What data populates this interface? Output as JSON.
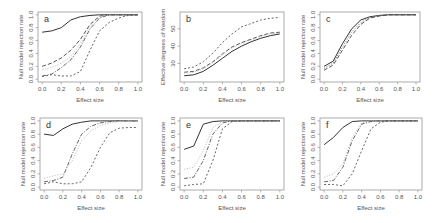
{
  "chart_data": [
    {
      "type": "line",
      "panel": "a",
      "title": "a",
      "xlabel": "Effect size",
      "ylabel": "Null model rejection rate",
      "xlim": [
        0,
        1
      ],
      "ylim": [
        0,
        1
      ],
      "xticks": [
        "0.0",
        "0.2",
        "0.4",
        "0.6",
        "0.8",
        "1.0"
      ],
      "yticks": [
        "0.0",
        "0.2",
        "0.4",
        "0.6",
        "0.8",
        "1.0"
      ],
      "x": [
        0,
        0.1,
        0.2,
        0.3,
        0.4,
        0.5,
        0.6,
        0.7,
        0.8,
        0.9,
        1.0
      ],
      "series": [
        {
          "name": "solid",
          "style": "solid",
          "color": "#333333",
          "values": [
            0.73,
            0.75,
            0.8,
            0.92,
            0.97,
            0.99,
            1,
            1,
            1,
            1,
            1
          ]
        },
        {
          "name": "long-dash",
          "style": "dashed",
          "color": "#444444",
          "values": [
            0.2,
            0.25,
            0.33,
            0.45,
            0.62,
            0.85,
            0.98,
            1,
            1,
            1,
            1
          ]
        },
        {
          "name": "light",
          "style": "dotted",
          "color": "#bbbbbb",
          "values": [
            0.15,
            0.18,
            0.25,
            0.35,
            0.55,
            0.82,
            0.97,
            1,
            1,
            1,
            1
          ]
        },
        {
          "name": "dash-dot",
          "style": "dashdot",
          "color": "#555555",
          "values": [
            0.05,
            0.08,
            0.18,
            0.3,
            0.5,
            0.78,
            0.95,
            1,
            1,
            1,
            1
          ]
        },
        {
          "name": "short-dash",
          "style": "shortdash",
          "color": "#555555",
          "values": [
            0.04,
            0.07,
            0.05,
            0.05,
            0.12,
            0.45,
            0.75,
            0.88,
            0.95,
            0.99,
            1
          ]
        }
      ]
    },
    {
      "type": "line",
      "panel": "b",
      "title": "b",
      "xlabel": "Effect size",
      "ylabel": "Effective degrees of freedom",
      "xlim": [
        0,
        1
      ],
      "ylim": [
        21,
        58
      ],
      "xticks": [
        "0.0",
        "0.2",
        "0.4",
        "0.6",
        "0.8",
        "1.0"
      ],
      "yticks": [
        "30",
        "40",
        "50"
      ],
      "x": [
        0,
        0.1,
        0.2,
        0.3,
        0.4,
        0.5,
        0.6,
        0.7,
        0.8,
        0.9,
        1.0
      ],
      "series": [
        {
          "name": "short-dash",
          "style": "shortdash",
          "color": "#555555",
          "values": [
            27,
            28,
            31,
            36,
            42,
            47,
            51,
            53,
            55,
            56,
            56.5
          ]
        },
        {
          "name": "long-dash",
          "style": "dashed",
          "color": "#444444",
          "values": [
            25,
            25.5,
            27.5,
            31,
            35.5,
            39.5,
            42,
            44,
            46,
            47.5,
            48
          ]
        },
        {
          "name": "light",
          "style": "dotted",
          "color": "#bbbbbb",
          "values": [
            24.5,
            25,
            27,
            30.5,
            35,
            39,
            41.5,
            43.5,
            45.5,
            47,
            47.5
          ]
        },
        {
          "name": "solid",
          "style": "solid",
          "color": "#333333",
          "values": [
            23,
            23.5,
            25.5,
            29,
            33,
            37,
            40,
            42.5,
            44.5,
            46,
            47
          ]
        }
      ]
    },
    {
      "type": "line",
      "panel": "c",
      "title": "c",
      "xlabel": "Effect size",
      "ylabel": "Null model rejection rate",
      "xlim": [
        0,
        1
      ],
      "ylim": [
        0,
        1
      ],
      "xticks": [
        "0.0",
        "0.2",
        "0.4",
        "0.6",
        "0.8",
        "1.0"
      ],
      "yticks": [
        "0.0",
        "0.2",
        "0.4",
        "0.6",
        "0.8",
        "1.0"
      ],
      "x": [
        0,
        0.1,
        0.2,
        0.3,
        0.4,
        0.5,
        0.6,
        0.7,
        0.8,
        0.9,
        1.0
      ],
      "series": [
        {
          "name": "solid",
          "style": "solid",
          "color": "#333333",
          "values": [
            0.2,
            0.28,
            0.55,
            0.78,
            0.92,
            0.97,
            0.99,
            1,
            1,
            1,
            1
          ]
        },
        {
          "name": "dotted",
          "style": "dotted",
          "color": "#777777",
          "values": [
            0.17,
            0.25,
            0.5,
            0.73,
            0.88,
            0.96,
            0.99,
            1,
            1,
            1,
            1
          ]
        },
        {
          "name": "dashed",
          "style": "dashed",
          "color": "#444444",
          "values": [
            0.14,
            0.22,
            0.45,
            0.68,
            0.85,
            0.95,
            0.98,
            1,
            1,
            1,
            1
          ]
        }
      ]
    },
    {
      "type": "line",
      "panel": "d",
      "title": "d",
      "xlabel": "Effect size",
      "ylabel": "Null model rejection rate",
      "xlim": [
        0,
        1
      ],
      "ylim": [
        0,
        1
      ],
      "xticks": [
        "0.0",
        "0.2",
        "0.4",
        "0.6",
        "0.8",
        "1.0"
      ],
      "yticks": [
        "0.0",
        "0.2",
        "0.4",
        "0.6",
        "0.8",
        "1.0"
      ],
      "x": [
        0,
        0.1,
        0.2,
        0.3,
        0.4,
        0.5,
        0.6,
        0.7,
        0.8,
        0.9,
        1.0
      ],
      "series": [
        {
          "name": "solid",
          "style": "solid",
          "color": "#333333",
          "values": [
            0.8,
            0.78,
            0.88,
            0.95,
            0.98,
            1,
            1,
            1,
            1,
            1,
            1
          ]
        },
        {
          "name": "dash-dot",
          "style": "dashdot",
          "color": "#555555",
          "values": [
            0.08,
            0.1,
            0.15,
            0.5,
            0.8,
            0.92,
            0.97,
            0.99,
            1,
            1,
            1
          ]
        },
        {
          "name": "light",
          "style": "dotted",
          "color": "#bbbbbb",
          "values": [
            0.13,
            0.17,
            0.2,
            0.4,
            0.7,
            0.85,
            0.93,
            0.97,
            0.99,
            1,
            1
          ]
        },
        {
          "name": "short-dash",
          "style": "shortdash",
          "color": "#555555",
          "values": [
            0.05,
            0.08,
            0.05,
            0.05,
            0.08,
            0.3,
            0.6,
            0.82,
            0.89,
            0.9,
            0.9
          ]
        }
      ]
    },
    {
      "type": "line",
      "panel": "e",
      "title": "e",
      "xlabel": "Effect size",
      "ylabel": "Null model rejection rate",
      "xlim": [
        0,
        1
      ],
      "ylim": [
        0,
        1
      ],
      "xticks": [
        "0.0",
        "0.2",
        "0.4",
        "0.6",
        "0.8",
        "1.0"
      ],
      "yticks": [
        "0.0",
        "0.2",
        "0.4",
        "0.6",
        "0.8",
        "1.0"
      ],
      "x": [
        0,
        0.1,
        0.2,
        0.3,
        0.4,
        0.5,
        0.6,
        0.7,
        0.8,
        0.9,
        1.0
      ],
      "series": [
        {
          "name": "solid",
          "style": "solid",
          "color": "#333333",
          "values": [
            0.57,
            0.62,
            0.95,
            0.99,
            1,
            1,
            1,
            1,
            1,
            1,
            1
          ]
        },
        {
          "name": "light",
          "style": "dotted",
          "color": "#bbbbbb",
          "values": [
            0.27,
            0.3,
            0.55,
            0.9,
            0.99,
            1,
            1,
            1,
            1,
            1,
            1
          ]
        },
        {
          "name": "dash-dot",
          "style": "dashdot",
          "color": "#555555",
          "values": [
            0.13,
            0.15,
            0.4,
            0.8,
            0.97,
            1,
            1,
            1,
            1,
            1,
            1
          ]
        },
        {
          "name": "short-dash",
          "style": "shortdash",
          "color": "#555555",
          "values": [
            0.02,
            0.04,
            0.05,
            0.4,
            0.88,
            0.99,
            1,
            1,
            1,
            1,
            1
          ]
        }
      ]
    },
    {
      "type": "line",
      "panel": "f",
      "title": "f",
      "xlabel": "Effect size",
      "ylabel": "Null model rejection rate",
      "xlim": [
        0,
        1
      ],
      "ylim": [
        0,
        1
      ],
      "xticks": [
        "0.0",
        "0.2",
        "0.4",
        "0.6",
        "0.8",
        "1.0"
      ],
      "yticks": [
        "0.0",
        "0.2",
        "0.4",
        "0.6",
        "0.8",
        "1.0"
      ],
      "x": [
        0,
        0.1,
        0.2,
        0.3,
        0.4,
        0.5,
        0.6,
        0.7,
        0.8,
        0.9,
        1.0
      ],
      "series": [
        {
          "name": "solid",
          "style": "solid",
          "color": "#333333",
          "values": [
            0.64,
            0.75,
            0.9,
            0.99,
            1,
            1,
            1,
            1,
            1,
            1,
            1
          ]
        },
        {
          "name": "light",
          "style": "dotted",
          "color": "#bbbbbb",
          "values": [
            0.15,
            0.2,
            0.35,
            0.75,
            0.97,
            1,
            1,
            1,
            1,
            1,
            1
          ]
        },
        {
          "name": "dash-dot",
          "style": "dashdot",
          "color": "#555555",
          "values": [
            0.08,
            0.1,
            0.3,
            0.7,
            0.95,
            0.99,
            1,
            1,
            1,
            1,
            1
          ]
        },
        {
          "name": "short-dash",
          "style": "shortdash",
          "color": "#555555",
          "values": [
            0.04,
            0.04,
            0.02,
            0.2,
            0.55,
            0.88,
            0.98,
            1,
            1,
            1,
            1
          ]
        }
      ]
    }
  ],
  "layout": {
    "panels": [
      {
        "box": [
          38,
          12,
          104,
          70
        ]
      },
      {
        "box": [
          180,
          12,
          104,
          70
        ]
      },
      {
        "box": [
          320,
          12,
          100,
          70
        ]
      },
      {
        "box": [
          40,
          118,
          102,
          72
        ]
      },
      {
        "box": [
          180,
          118,
          104,
          72
        ]
      },
      {
        "box": [
          320,
          118,
          102,
          72
        ]
      }
    ]
  }
}
